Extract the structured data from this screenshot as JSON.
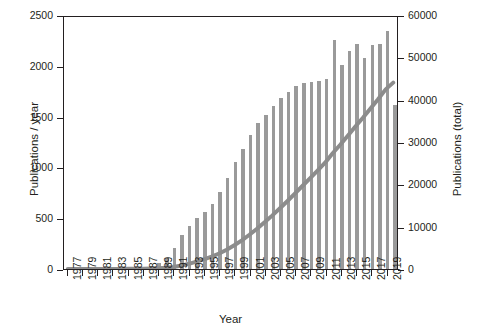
{
  "chart_data": {
    "type": "bar",
    "title": "",
    "xlabel": "Year",
    "ylabel": "Publications / year",
    "ylabel_secondary": "Publications (total)",
    "grid": false,
    "legend": null,
    "ylim": [
      0,
      2500
    ],
    "ylim_secondary": [
      0,
      60000
    ],
    "xlim_labels": [
      "1977",
      "2019"
    ],
    "yticks": [
      "0",
      "500",
      "1000",
      "1500",
      "2000",
      "2500"
    ],
    "yticks_secondary": [
      "0",
      "10000",
      "20000",
      "30000",
      "40000",
      "50000",
      "60000"
    ],
    "xticks": [
      "1977",
      "1979",
      "1981",
      "1983",
      "1985",
      "1987",
      "1989",
      "1991",
      "1993",
      "1995",
      "1997",
      "1999",
      "2001",
      "2003",
      "2005",
      "2007",
      "2009",
      "2011",
      "2013",
      "2015",
      "2017",
      "2019"
    ],
    "bar_color": "#9a9a9a",
    "line_color": "#8c8c8c",
    "axis_color": "#231f20",
    "categories": [
      1977,
      1978,
      1979,
      1980,
      1981,
      1982,
      1983,
      1984,
      1985,
      1986,
      1987,
      1988,
      1989,
      1990,
      1991,
      1992,
      1993,
      1994,
      1995,
      1996,
      1997,
      1998,
      1999,
      2000,
      2001,
      2002,
      2003,
      2004,
      2005,
      2006,
      2007,
      2008,
      2009,
      2010,
      2011,
      2012,
      2013,
      2014,
      2015,
      2016,
      2017,
      2018,
      2019,
      2020
    ],
    "series": [
      {
        "name": "Publications / year",
        "axis": "left",
        "values": [
          2,
          2,
          3,
          3,
          4,
          5,
          6,
          8,
          10,
          14,
          20,
          32,
          60,
          110,
          210,
          330,
          420,
          500,
          560,
          640,
          760,
          900,
          1050,
          1180,
          1320,
          1440,
          1520,
          1600,
          1680,
          1740,
          1800,
          1830,
          1840,
          1850,
          1870,
          2250,
          2010,
          2150,
          2210,
          2080,
          2200,
          2210,
          2340,
          1610
        ]
      },
      {
        "name": "Publications (total)",
        "axis": "right",
        "values": [
          2,
          4,
          7,
          10,
          14,
          19,
          25,
          33,
          43,
          57,
          77,
          109,
          169,
          279,
          489,
          819,
          1239,
          1739,
          2299,
          2939,
          3699,
          4599,
          5649,
          6829,
          8149,
          9589,
          11109,
          12709,
          14389,
          16129,
          17929,
          19759,
          21599,
          23449,
          25319,
          27569,
          29579,
          31729,
          33939,
          36019,
          38219,
          40429,
          42769,
          44379
        ]
      }
    ]
  }
}
